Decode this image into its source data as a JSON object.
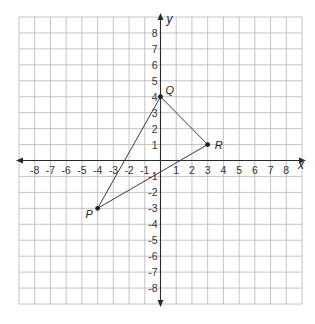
{
  "diagram": {
    "title": "",
    "x_axis": {
      "label": "x",
      "min": -9,
      "max": 9,
      "tick_labels": [
        -8,
        -7,
        -6,
        -5,
        -4,
        -3,
        -2,
        -1,
        1,
        2,
        3,
        4,
        5,
        6,
        7,
        8
      ]
    },
    "y_axis": {
      "label": "y",
      "min": -9,
      "max": 9,
      "tick_labels": [
        8,
        7,
        6,
        5,
        4,
        3,
        2,
        1,
        -1,
        -2,
        -3,
        -4,
        -5,
        -6,
        -7,
        -8
      ]
    },
    "points": [
      {
        "name": "Q",
        "x": 0,
        "y": 4
      },
      {
        "name": "R",
        "x": 3,
        "y": 1
      },
      {
        "name": "P",
        "x": -4,
        "y": -3
      }
    ],
    "segments": [
      {
        "from": "P",
        "to": "Q"
      },
      {
        "from": "Q",
        "to": "R"
      },
      {
        "from": "R",
        "to": "P"
      }
    ],
    "colors": {
      "grid": "#bdbdbd",
      "axis": "#2b2b2b",
      "segment": "#3a3a3a",
      "point": "#1e1e1e"
    }
  }
}
